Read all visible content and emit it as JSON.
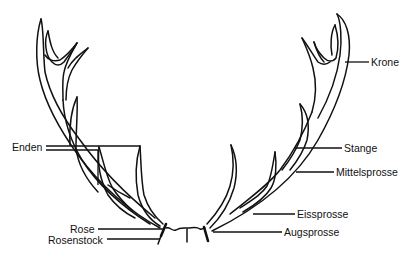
{
  "diagram": {
    "type": "labeled-illustration",
    "colors": {
      "ink": "#111111",
      "background": "#ffffff"
    },
    "labels": {
      "krone": "Krone",
      "enden": "Enden",
      "stange": "Stange",
      "mittelsprosse": "Mittelsprosse",
      "eissprosse": "Eissprosse",
      "augsprosse": "Augsprosse",
      "rose": "Rose",
      "rosenstock": "Rosenstock"
    }
  }
}
